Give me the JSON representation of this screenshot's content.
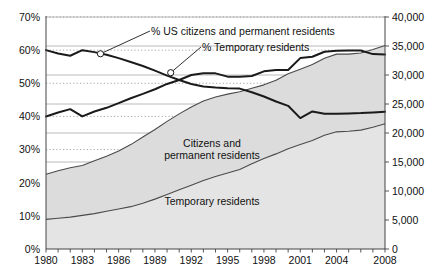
{
  "chart_data": {
    "type": "area",
    "title": "",
    "subtitle": "",
    "xlabel": "",
    "ylabel": "",
    "grid": true,
    "legend_position": "inline-annotations",
    "x": [
      1980,
      1981,
      1982,
      1983,
      1984,
      1985,
      1986,
      1987,
      1988,
      1989,
      1990,
      1991,
      1992,
      1993,
      1994,
      1995,
      1996,
      1997,
      1998,
      1999,
      2000,
      2001,
      2002,
      2003,
      2004,
      2005,
      2006,
      2007,
      2008
    ],
    "left_axis": {
      "label": "",
      "ylim": [
        0,
        70
      ],
      "ticks": [
        "0%",
        "10%",
        "20%",
        "30%",
        "40%",
        "50%",
        "60%",
        "70%"
      ],
      "tick_values": [
        0,
        10,
        20,
        30,
        40,
        50,
        60,
        70
      ],
      "unit": "%"
    },
    "right_axis": {
      "label": "",
      "ylim": [
        0,
        40000
      ],
      "ticks": [
        "0",
        "5,000",
        "10,000",
        "15,000",
        "20,000",
        "25,000",
        "30,000",
        "35,000",
        "40,000"
      ],
      "tick_values": [
        0,
        5000,
        10000,
        15000,
        20000,
        25000,
        30000,
        35000,
        40000
      ]
    },
    "x_ticks": [
      "1980",
      "1983",
      "1986",
      "1989",
      "1992",
      "1995",
      "1998",
      "2001",
      "2004",
      "2008"
    ],
    "x_tick_values": [
      1980,
      1983,
      1986,
      1989,
      1992,
      1995,
      1998,
      2001,
      2004,
      2008
    ],
    "series": [
      {
        "name": "Temporary residents",
        "kind": "area",
        "axis": "right",
        "label": "Temporary residents",
        "fill": "#e4e4e4",
        "stroke": "#4a4a4a",
        "values": [
          5100,
          5300,
          5500,
          5800,
          6100,
          6500,
          6900,
          7300,
          7900,
          8600,
          9400,
          10200,
          11000,
          11800,
          12500,
          13100,
          13700,
          14700,
          15600,
          16400,
          17300,
          18000,
          18700,
          19600,
          20200,
          20300,
          20500,
          21000,
          21600
        ]
      },
      {
        "name": "Citizens and permanent residents",
        "kind": "area",
        "axis": "right",
        "label": "Citizens and\npermanent residents",
        "label_line1": "Citizens and",
        "label_line2": "permanent residents",
        "fill": "#dcdcdc",
        "stroke": "#4a4a4a",
        "values": [
          7800,
          8200,
          8500,
          8600,
          9100,
          9500,
          10000,
          10700,
          11400,
          12000,
          12600,
          13100,
          13500,
          13700,
          13700,
          13600,
          13400,
          13000,
          12700,
          12700,
          12900,
          13000,
          13100,
          13300,
          13400,
          13300,
          13300,
          13400,
          13500
        ]
      },
      {
        "name": "% US citizens and permanent residents",
        "kind": "line",
        "axis": "left",
        "label": "% US citizens and permanent residents",
        "stroke": "#1a1a1a",
        "values": [
          60.0,
          59.0,
          58.3,
          60.0,
          59.4,
          58.6,
          57.6,
          56.4,
          55.2,
          53.8,
          52.3,
          51.0,
          49.8,
          49.0,
          48.7,
          48.5,
          48.4,
          47.3,
          46.0,
          44.5,
          43.2,
          39.5,
          41.5,
          40.8,
          40.8,
          40.9,
          41.0,
          41.2,
          41.4
        ],
        "callout": {
          "year": 1984.5,
          "value": 58.9
        }
      },
      {
        "name": "% Temporary residents",
        "kind": "line",
        "axis": "left",
        "label": "% Temporary residents",
        "stroke": "#1a1a1a",
        "values": [
          40.0,
          41.2,
          42.2,
          40.0,
          41.5,
          42.6,
          44.0,
          45.5,
          46.8,
          48.2,
          49.8,
          51.0,
          52.5,
          53.0,
          53.0,
          52.0,
          52.0,
          52.2,
          53.6,
          54.0,
          54.0,
          57.6,
          58.0,
          59.5,
          59.8,
          59.9,
          59.9,
          58.8,
          58.7
        ],
        "callout": {
          "year": 1990.3,
          "value": 53.2
        }
      }
    ],
    "annotations": [
      {
        "name": "callout-us-citizens",
        "text": "% US citizens and permanent residents"
      },
      {
        "name": "callout-temporary",
        "text": "% Temporary residents"
      },
      {
        "name": "area-label-citizens-line1",
        "text": "Citizens and"
      },
      {
        "name": "area-label-citizens-line2",
        "text": "permanent residents"
      },
      {
        "name": "area-label-temporary",
        "text": "Temporary residents"
      }
    ],
    "colors": {
      "area_citizens": "#dcdcdc",
      "area_temporary": "#e4e4e4",
      "line": "#1a1a1a",
      "grid": "#9a9a9a",
      "axis": "#333333",
      "background": "#ffffff"
    }
  }
}
